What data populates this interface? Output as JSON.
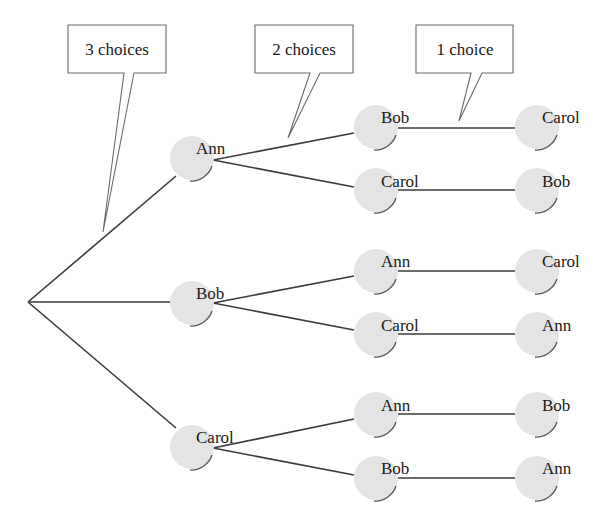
{
  "diagram": {
    "type": "tree",
    "colors": {
      "edge": "#3a3a3a",
      "node_fill": "#e4e4e4",
      "node_shadow": "#555555",
      "callout_border": "#6a6a6a",
      "text": "#1a1a1a",
      "background": "#ffffff"
    },
    "callouts": [
      {
        "label": "3 choices"
      },
      {
        "label": "2 choices"
      },
      {
        "label": "1 choice"
      }
    ],
    "level1": [
      {
        "label": "Ann"
      },
      {
        "label": "Bob"
      },
      {
        "label": "Carol"
      }
    ],
    "level2": [
      {
        "label": "Bob"
      },
      {
        "label": "Carol"
      },
      {
        "label": "Ann"
      },
      {
        "label": "Carol"
      },
      {
        "label": "Ann"
      },
      {
        "label": "Bob"
      }
    ],
    "level3": [
      {
        "label": "Carol"
      },
      {
        "label": "Bob"
      },
      {
        "label": "Carol"
      },
      {
        "label": "Ann"
      },
      {
        "label": "Bob"
      },
      {
        "label": "Ann"
      }
    ]
  }
}
